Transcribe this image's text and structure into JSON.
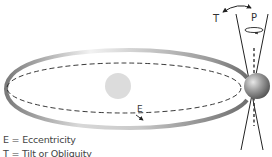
{
  "diagram": {
    "labels": {
      "tilt": "T",
      "precession": "P",
      "eccentricity": "E"
    },
    "legend": [
      {
        "text": "E = Eccentricity"
      },
      {
        "text": "T = Tilt or Obliquity"
      }
    ],
    "elements": {
      "sun": "sun",
      "earth": "earth",
      "orbit": "elliptical orbit",
      "axis": "rotation axis"
    },
    "colors": {
      "orbit_band": "#9a9a9a",
      "sun": "#dcdcdc",
      "earth": "#8a8a8a",
      "lines": "#222222"
    }
  }
}
